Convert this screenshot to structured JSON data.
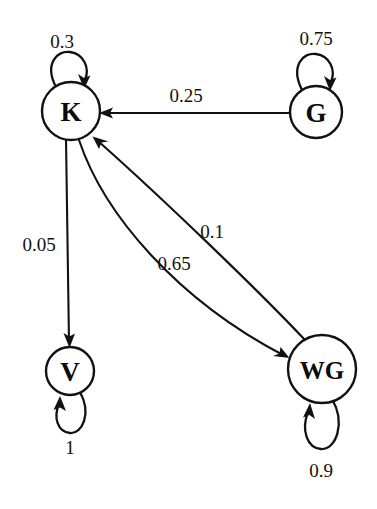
{
  "diagram": {
    "type": "state-transition-graph",
    "background_color": "#ffffff",
    "stroke_color": "#111111",
    "nodes": [
      {
        "id": "K",
        "label": "K",
        "cx": 71,
        "cy": 111,
        "r": 29
      },
      {
        "id": "G",
        "label": "G",
        "cx": 316,
        "cy": 112,
        "r": 26
      },
      {
        "id": "V",
        "label": "V",
        "cx": 70,
        "cy": 371,
        "r": 24
      },
      {
        "id": "WG",
        "label": "WG",
        "cx": 322,
        "cy": 369,
        "r": 34
      }
    ],
    "edges": [
      {
        "from": "K",
        "to": "K",
        "label": "0.3",
        "kind": "self-loop-top",
        "label_x": 62,
        "label_y": 41
      },
      {
        "from": "G",
        "to": "G",
        "label": "0.75",
        "kind": "self-loop-top",
        "label_x": 316,
        "label_y": 38
      },
      {
        "from": "G",
        "to": "K",
        "label": "0.25",
        "kind": "straight",
        "label_x": 186,
        "label_y": 95
      },
      {
        "from": "K",
        "to": "V",
        "label": "0.05",
        "kind": "straight",
        "label_x": 39,
        "label_y": 244
      },
      {
        "from": "WG",
        "to": "K",
        "label": "0.1",
        "kind": "curve",
        "label_x": 212,
        "label_y": 231
      },
      {
        "from": "K",
        "to": "WG",
        "label": "0.65",
        "kind": "curve",
        "label_x": 174,
        "label_y": 263
      },
      {
        "from": "V",
        "to": "V",
        "label": "1",
        "kind": "self-loop-bottom",
        "label_x": 70,
        "label_y": 447
      },
      {
        "from": "WG",
        "to": "WG",
        "label": "0.9",
        "kind": "self-loop-bottom",
        "label_x": 321,
        "label_y": 470
      }
    ]
  }
}
